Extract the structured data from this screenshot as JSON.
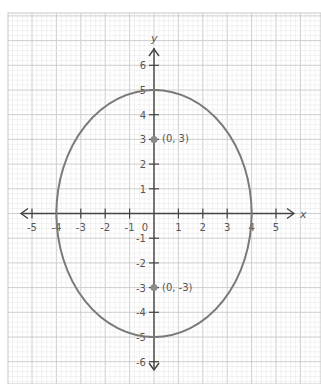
{
  "chart_data": {
    "type": "scatter",
    "title": "",
    "xlabel": "x",
    "ylabel": "y",
    "xlim": [
      -5.8,
      6.5
    ],
    "ylim": [
      -6.7,
      7.8
    ],
    "grid": true,
    "x_ticks": [
      "-5",
      "-4",
      "-3",
      "-2",
      "-1",
      "0",
      "1",
      "2",
      "3",
      "4",
      "5"
    ],
    "y_ticks": [
      "6",
      "5",
      "4",
      "3",
      "2",
      "1",
      "-1",
      "-2",
      "-3",
      "-4",
      "-5",
      "-6"
    ],
    "curve": {
      "kind": "ellipse",
      "center": [
        0,
        0
      ],
      "semi_axis_x": 4,
      "semi_axis_y": 5,
      "equation": "x^2/16 + y^2/25 = 1"
    },
    "points": [
      {
        "x": 0,
        "y": 3,
        "label": "(0, 3)"
      },
      {
        "x": 0,
        "y": -3,
        "label": "(0, -3)"
      }
    ]
  },
  "colors": {
    "grid_minor": "#e4e4e4",
    "grid_major": "#c8c8c8",
    "axis": "#444444",
    "curve": "#7a7a7a",
    "point": "#8a8a8a",
    "label": "#555555"
  },
  "axis_labels": {
    "x": "x",
    "y": "y"
  },
  "point_labels": {
    "focus_top": "(0, 3)",
    "focus_bottom": "(0, -3)"
  }
}
